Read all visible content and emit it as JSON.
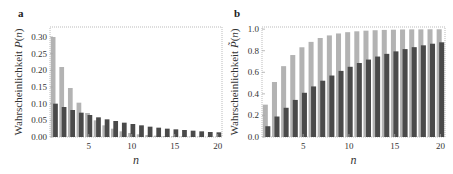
{
  "colors": {
    "light": "#b3b3b3",
    "dark": "#4a4a4a",
    "frame": "#aaaaaa",
    "text": "#333333"
  },
  "chart_data": [
    {
      "panel": "a",
      "type": "bar",
      "title": "",
      "xlabel": "n",
      "ylabel": "Wahrscheinlichkeit P(n)",
      "ylabel_parts": [
        "Wahrscheinlichkeit ",
        "P",
        "(",
        "n",
        ")"
      ],
      "xlim": [
        0.5,
        20.5
      ],
      "ylim": [
        0,
        0.33
      ],
      "xticks": [
        5,
        10,
        15,
        20
      ],
      "yticks": [
        "0.00",
        "0.05",
        "0.10",
        "0.15",
        "0.20",
        "0.25",
        "0.30"
      ],
      "ytick_values": [
        0,
        0.05,
        0.1,
        0.15,
        0.2,
        0.25,
        0.3
      ],
      "grid": false,
      "categories": [
        1,
        2,
        3,
        4,
        5,
        6,
        7,
        8,
        9,
        10,
        11,
        12,
        13,
        14,
        15,
        16,
        17,
        18,
        19,
        20
      ],
      "series": [
        {
          "name": "light",
          "values": [
            0.3,
            0.21,
            0.147,
            0.103,
            0.072,
            0.05,
            0.035,
            0.025,
            0.017,
            0.012,
            0.008,
            0.006,
            0.004,
            0.003,
            0.002,
            0.001,
            0.001,
            0.001,
            0.0,
            0.0
          ]
        },
        {
          "name": "dark",
          "values": [
            0.1,
            0.09,
            0.081,
            0.073,
            0.066,
            0.059,
            0.053,
            0.048,
            0.043,
            0.039,
            0.035,
            0.031,
            0.028,
            0.025,
            0.023,
            0.021,
            0.019,
            0.017,
            0.015,
            0.014
          ]
        }
      ]
    },
    {
      "panel": "b",
      "type": "bar",
      "title": "",
      "xlabel": "n",
      "ylabel": "Wahrscheinlichkeit P̃(n)",
      "ylabel_parts": [
        "Wahrscheinlichkeit ",
        "P̃",
        "(",
        "n",
        ")"
      ],
      "xlim": [
        0.5,
        20.5
      ],
      "ylim": [
        0,
        1.02
      ],
      "xticks": [
        5,
        10,
        15,
        20
      ],
      "yticks": [
        "0.0",
        "0.2",
        "0.4",
        "0.6",
        "0.8",
        "1.0"
      ],
      "ytick_values": [
        0,
        0.2,
        0.4,
        0.6,
        0.8,
        1.0
      ],
      "grid": false,
      "categories": [
        1,
        2,
        3,
        4,
        5,
        6,
        7,
        8,
        9,
        10,
        11,
        12,
        13,
        14,
        15,
        16,
        17,
        18,
        19,
        20
      ],
      "series": [
        {
          "name": "light",
          "values": [
            0.3,
            0.51,
            0.657,
            0.76,
            0.832,
            0.882,
            0.918,
            0.942,
            0.96,
            0.972,
            0.98,
            0.986,
            0.99,
            0.993,
            0.995,
            0.997,
            0.998,
            0.998,
            0.999,
            0.999
          ]
        },
        {
          "name": "dark",
          "values": [
            0.1,
            0.19,
            0.271,
            0.344,
            0.41,
            0.469,
            0.522,
            0.57,
            0.613,
            0.651,
            0.686,
            0.718,
            0.746,
            0.771,
            0.794,
            0.815,
            0.833,
            0.85,
            0.865,
            0.878
          ]
        }
      ]
    }
  ]
}
